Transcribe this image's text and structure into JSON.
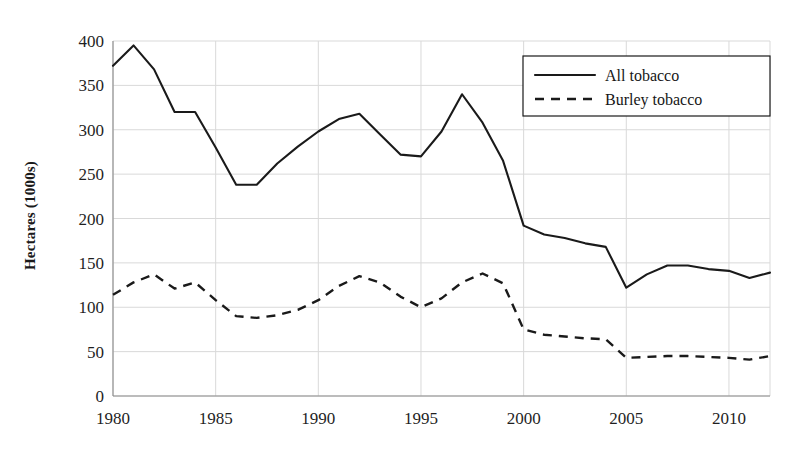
{
  "chart_data": {
    "type": "line",
    "title": "",
    "xlabel": "",
    "ylabel": "Hectares (1000s)",
    "xlim": [
      1980,
      2012
    ],
    "ylim": [
      0,
      400
    ],
    "grid": true,
    "legend_position": "top-right",
    "x": [
      1980,
      1981,
      1982,
      1983,
      1984,
      1985,
      1986,
      1987,
      1988,
      1989,
      1990,
      1991,
      1992,
      1993,
      1994,
      1995,
      1996,
      1997,
      1998,
      1999,
      2000,
      2001,
      2002,
      2003,
      2004,
      2005,
      2006,
      2007,
      2008,
      2009,
      2010,
      2011,
      2012
    ],
    "xticks": [
      "1980",
      "1985",
      "1990",
      "1995",
      "2000",
      "2005",
      "2010"
    ],
    "xtick_values": [
      1980,
      1985,
      1990,
      1995,
      2000,
      2005,
      2010
    ],
    "yticks": [
      "0",
      "50",
      "100",
      "150",
      "200",
      "250",
      "300",
      "350",
      "400"
    ],
    "ytick_values": [
      0,
      50,
      100,
      150,
      200,
      250,
      300,
      350,
      400
    ],
    "series": [
      {
        "name": "All tobacco",
        "style": "solid",
        "color": "#1a1a1a",
        "values": [
          372,
          395,
          368,
          320,
          320,
          280,
          238,
          238,
          262,
          281,
          298,
          312,
          318,
          295,
          272,
          270,
          298,
          340,
          308,
          265,
          192,
          182,
          178,
          172,
          168,
          122,
          137,
          147,
          147,
          143,
          141,
          133,
          139
        ]
      },
      {
        "name": "Burley tobacco",
        "style": "dashed",
        "color": "#1a1a1a",
        "values": [
          114,
          128,
          137,
          121,
          128,
          108,
          90,
          88,
          91,
          97,
          108,
          124,
          135,
          128,
          112,
          100,
          110,
          128,
          138,
          127,
          75,
          69,
          67,
          65,
          64,
          43,
          44,
          45,
          45,
          44,
          43,
          41,
          45
        ]
      }
    ]
  },
  "legend": {
    "items": [
      {
        "label": "All tobacco",
        "style": "solid"
      },
      {
        "label": "Burley tobacco",
        "style": "dashed"
      }
    ]
  },
  "axis": {
    "y_title": "Hectares (1000s)"
  }
}
